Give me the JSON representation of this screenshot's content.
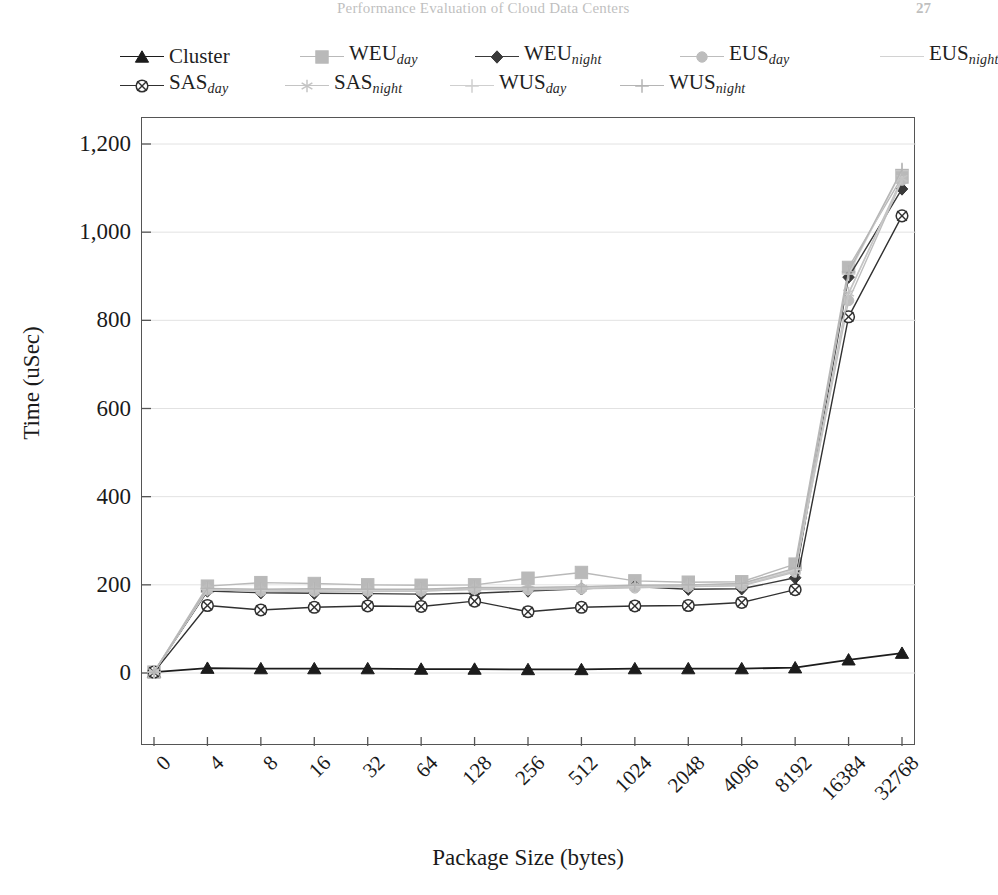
{
  "header": {
    "title": "Performance Evaluation of Cloud Data Centers",
    "page_number": "27"
  },
  "axis_title_y": "Time (uSec)",
  "axis_title_x": "Package Size (bytes)",
  "legend": {
    "rows": [
      [
        {
          "name": "Cluster",
          "base": "Cluster",
          "sub": "",
          "marker": "triangle",
          "color": "#1c1c1c"
        },
        {
          "name": "WEU_day",
          "base": "WEU",
          "sub": "day",
          "marker": "square",
          "color": "#b9b9b9"
        },
        {
          "name": "WEU_night",
          "base": "WEU",
          "sub": "night",
          "marker": "diamond",
          "color": "#3a3a3a"
        },
        {
          "name": "EUS_day",
          "base": "EUS",
          "sub": "day",
          "marker": "circle",
          "color": "#bdbdbd"
        },
        {
          "name": "EUS_night",
          "base": "EUS",
          "sub": "night",
          "marker": "none",
          "color": "#d2d2d2"
        }
      ],
      [
        {
          "name": "SAS_day",
          "base": "SAS",
          "sub": "day",
          "marker": "crosscircle",
          "color": "#303030"
        },
        {
          "name": "SAS_night",
          "base": "SAS",
          "sub": "night",
          "marker": "star",
          "color": "#c4c4c4"
        },
        {
          "name": "WUS_day",
          "base": "WUS",
          "sub": "day",
          "marker": "plus",
          "color": "#cfcfcf"
        },
        {
          "name": "WUS_night",
          "base": "WUS",
          "sub": "night",
          "marker": "plus",
          "color": "#b5b5b5"
        }
      ]
    ]
  },
  "chart_data": {
    "type": "line",
    "title": "",
    "xlabel": "Package Size (bytes)",
    "ylabel": "Time (uSec)",
    "categories": [
      "0",
      "4",
      "8",
      "16",
      "32",
      "64",
      "128",
      "256",
      "512",
      "1024",
      "2048",
      "4096",
      "8192",
      "16384",
      "32768"
    ],
    "ylim": [
      0,
      1200
    ],
    "yticks": [
      "0",
      "200",
      "400",
      "600",
      "800",
      "1,000",
      "1,200"
    ],
    "ytick_values": [
      0,
      200,
      400,
      600,
      800,
      1000,
      1200
    ],
    "grid": true,
    "legend_position": "top",
    "series": [
      {
        "name": "Cluster",
        "marker": "triangle",
        "color": "#1c1c1c",
        "values": [
          2,
          11,
          10,
          10,
          10,
          9,
          9,
          8,
          8,
          10,
          10,
          10,
          12,
          30,
          45
        ]
      },
      {
        "name": "WEU_day",
        "marker": "square",
        "color": "#b9b9b9",
        "values": [
          2,
          197,
          205,
          203,
          200,
          199,
          200,
          215,
          228,
          209,
          206,
          207,
          247,
          920,
          1125
        ]
      },
      {
        "name": "WEU_night",
        "marker": "diamond",
        "color": "#3a3a3a",
        "values": [
          2,
          186,
          182,
          181,
          180,
          179,
          181,
          186,
          191,
          196,
          190,
          191,
          216,
          898,
          1098
        ]
      },
      {
        "name": "EUS_day",
        "marker": "circle",
        "color": "#bdbdbd",
        "values": [
          2,
          189,
          186,
          186,
          186,
          186,
          190,
          189,
          191,
          193,
          196,
          198,
          229,
          845,
          1118
        ]
      },
      {
        "name": "EUS_night",
        "marker": "none",
        "color": "#d2d2d2",
        "values": [
          2,
          190,
          188,
          188,
          188,
          188,
          191,
          191,
          193,
          195,
          197,
          200,
          232,
          860,
          1120
        ]
      },
      {
        "name": "SAS_day",
        "marker": "crosscircle",
        "color": "#303030",
        "values": [
          2,
          153,
          143,
          149,
          152,
          151,
          163,
          139,
          149,
          152,
          153,
          160,
          189,
          808,
          1037
        ]
      },
      {
        "name": "SAS_night",
        "marker": "star",
        "color": "#c4c4c4",
        "values": [
          2,
          188,
          186,
          186,
          185,
          186,
          190,
          190,
          192,
          195,
          196,
          199,
          231,
          862,
          1122
        ]
      },
      {
        "name": "WUS_day",
        "marker": "plus",
        "color": "#cfcfcf",
        "values": [
          2,
          191,
          189,
          190,
          189,
          189,
          193,
          193,
          195,
          198,
          199,
          202,
          235,
          905,
          1140
        ]
      },
      {
        "name": "WUS_night",
        "marker": "plus",
        "color": "#b5b5b5",
        "values": [
          2,
          192,
          190,
          191,
          190,
          190,
          194,
          194,
          196,
          199,
          200,
          203,
          238,
          910,
          1142
        ]
      }
    ]
  }
}
